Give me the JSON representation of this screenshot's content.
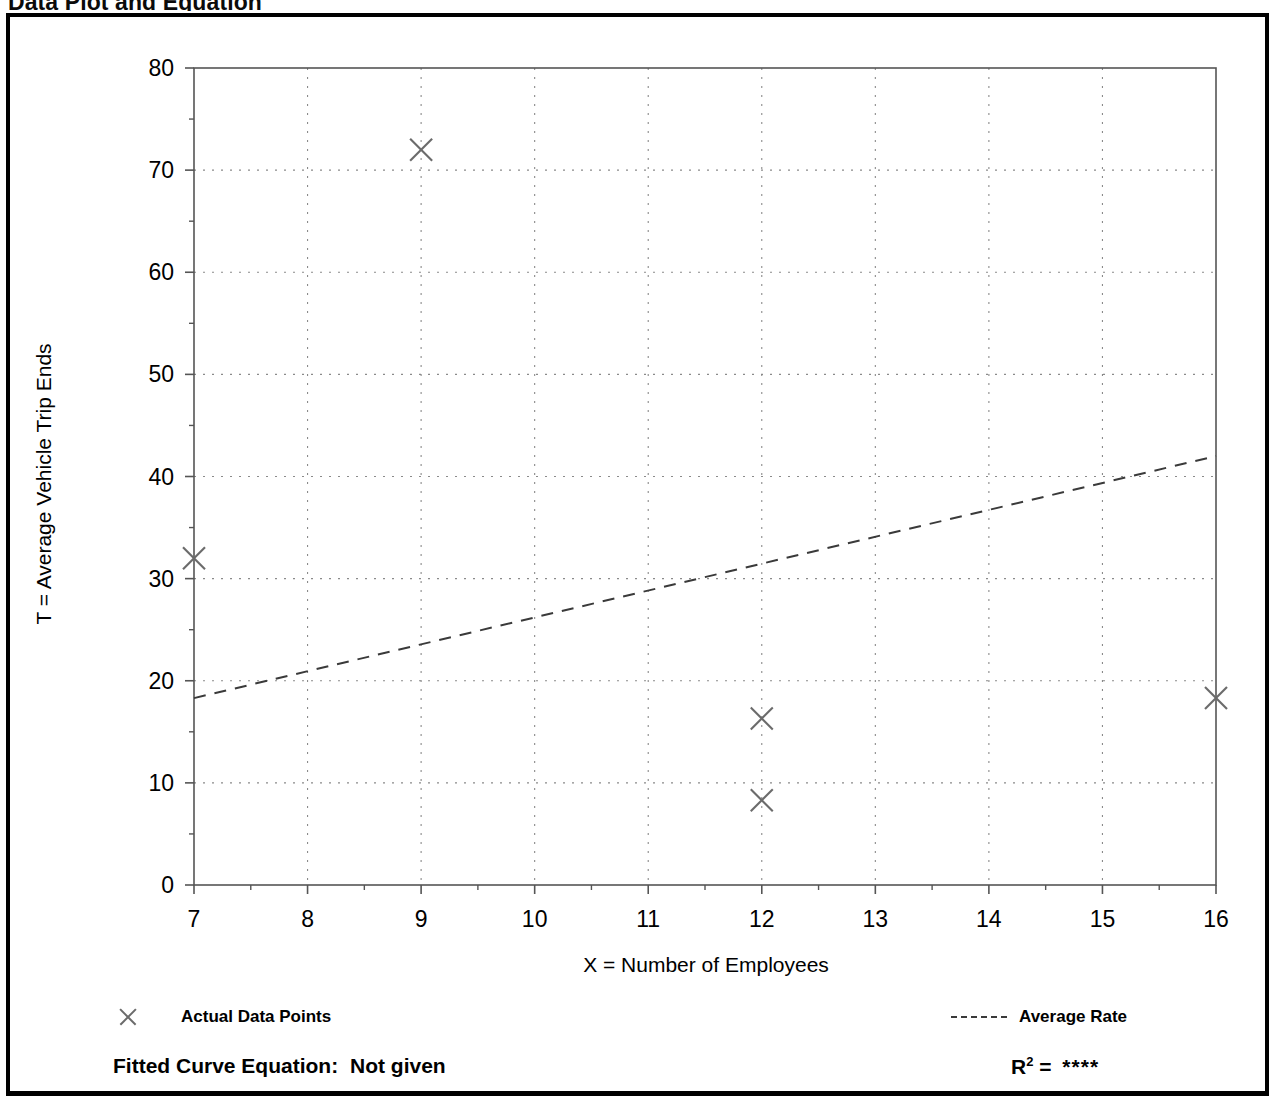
{
  "page": {
    "title_left": "Data Plot and Equation",
    "title_right": ""
  },
  "legend": {
    "points": {
      "label": "Actual Data Points",
      "icon": "x-marker-icon"
    },
    "rate": {
      "label": "Average Rate",
      "icon": "dashed-line-icon"
    }
  },
  "footer": {
    "equation_label": "Fitted Curve Equation:",
    "equation_value": "Not given",
    "r2_label": "R",
    "r2_exponent": "2",
    "r2_equals": "=",
    "r2_value": "****"
  },
  "colors": {
    "axis": "#555555",
    "grid": "#8a8a8a",
    "marker": "#6b6b6b",
    "trendline": "#3a3a3a",
    "frame": "#000000",
    "text": "#000000"
  },
  "chart_data": {
    "type": "scatter",
    "title": "Data Plot and Equation",
    "xlabel": "X = Number of Employees",
    "ylabel": "T = Average Vehicle Trip Ends",
    "xlim": [
      7,
      16
    ],
    "ylim": [
      0,
      80
    ],
    "xticks": [
      7,
      8,
      9,
      10,
      11,
      12,
      13,
      14,
      15,
      16
    ],
    "xticklabels": [
      "7",
      "8",
      "9",
      "10",
      "11",
      "12",
      "13",
      "14",
      "15",
      "16"
    ],
    "xminor_step": 0.5,
    "yticks": [
      0,
      10,
      20,
      30,
      40,
      50,
      60,
      70,
      80
    ],
    "yticklabels": [
      "0",
      "10",
      "20",
      "30",
      "40",
      "50",
      "60",
      "70",
      "80"
    ],
    "yminor_step": 5,
    "grid": true,
    "grid_style": "dotted",
    "legend_position": "below-plot",
    "series": [
      {
        "name": "Actual Data Points",
        "type": "scatter",
        "marker": "x",
        "points": [
          {
            "x": 7,
            "y": 32
          },
          {
            "x": 9,
            "y": 72
          },
          {
            "x": 12,
            "y": 16.3
          },
          {
            "x": 12,
            "y": 8.3
          },
          {
            "x": 16,
            "y": 18.3
          }
        ]
      },
      {
        "name": "Average Rate",
        "type": "line",
        "style": "dashed",
        "points": [
          {
            "x": 7,
            "y": 18.3
          },
          {
            "x": 16,
            "y": 42
          }
        ]
      }
    ]
  }
}
